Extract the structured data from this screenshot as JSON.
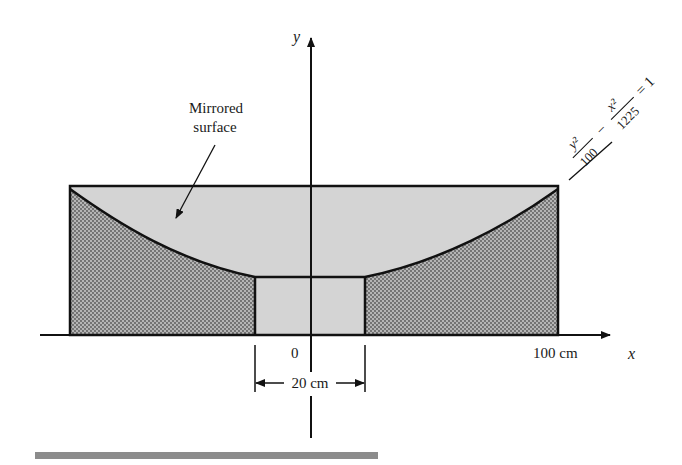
{
  "diagram": {
    "axes": {
      "x_label": "x",
      "y_label": "y",
      "origin_label": "0",
      "x_tick_label": "100 cm"
    },
    "annotation": {
      "line1": "Mirrored",
      "line2": "surface"
    },
    "dimension": {
      "label": "20 cm"
    },
    "equation": {
      "term1_num": "y²",
      "term1_den": "100",
      "minus": "−",
      "term2_num": "x²",
      "term2_den": "1225",
      "equals": "= 1"
    },
    "colors": {
      "light_fill": "#d4d4d4",
      "dotted_fill": "#9a9a9a",
      "stroke": "#111111",
      "bottom_bar": "#8c8c8c"
    }
  }
}
